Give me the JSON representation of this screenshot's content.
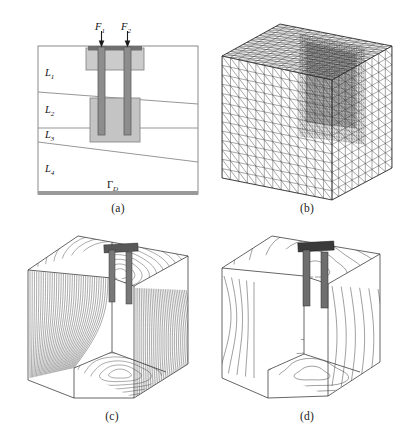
{
  "figure": {
    "panels": [
      {
        "key": "a",
        "caption": "(a)",
        "description": "2D cross-section of layered soil domain with two piles and cap",
        "labels": {
          "force1": "F",
          "force1_sub": "1",
          "force2": "F",
          "force2_sub": "2",
          "layer1": "L",
          "layer1_sub": "1",
          "layer2": "L",
          "layer2_sub": "2",
          "layer3": "L",
          "layer3_sub": "3",
          "layer4": "L",
          "layer4_sub": "4",
          "dirichlet": "Γ",
          "dirichlet_sub": "D"
        }
      },
      {
        "key": "b",
        "caption": "(b)",
        "description": "3D tetrahedral finite element mesh of the cube domain with local refinement"
      },
      {
        "key": "c",
        "caption": "(c)",
        "description": "Cut-away cube with dense isocontour lines of the solution field"
      },
      {
        "key": "d",
        "caption": "(d)",
        "description": "Cut-away cube with sparse isocontour lines concentrated around the piles"
      }
    ],
    "colors": {
      "outline": "#8a8a8a",
      "cap_fill": "#c9c9c9",
      "block_fill": "#c4c4c4",
      "pile_fill": "#8d8d8d",
      "pile_edge": "#5a5a5a",
      "boundary_band": "#9a9a9a",
      "mesh_line": "#3a3a3a",
      "contour_line": "#2b2b2b",
      "text": "#222222"
    },
    "geometry_a": {
      "box": {
        "x": 10,
        "y": 26,
        "w": 160,
        "h": 148
      },
      "interfaces": [
        {
          "name": "L1-L2",
          "x1": 10,
          "y1": 72,
          "x2": 170,
          "y2": 84
        },
        {
          "name": "L2-L3",
          "x1": 10,
          "y1": 108,
          "x2": 170,
          "y2": 108
        },
        {
          "name": "L3-L4",
          "x1": 10,
          "y1": 120,
          "x2": 170,
          "y2": 142
        }
      ],
      "cap": {
        "x": 58,
        "y": 26,
        "w": 58,
        "h": 22
      },
      "block": {
        "x": 62,
        "y": 78,
        "w": 50,
        "h": 44
      },
      "piles": [
        {
          "x": 71,
          "y": 28,
          "w": 7,
          "h": 86
        },
        {
          "x": 96,
          "y": 28,
          "w": 7,
          "h": 86
        }
      ],
      "beam": {
        "x": 62,
        "y": 26,
        "w": 50,
        "h": 5
      }
    }
  }
}
